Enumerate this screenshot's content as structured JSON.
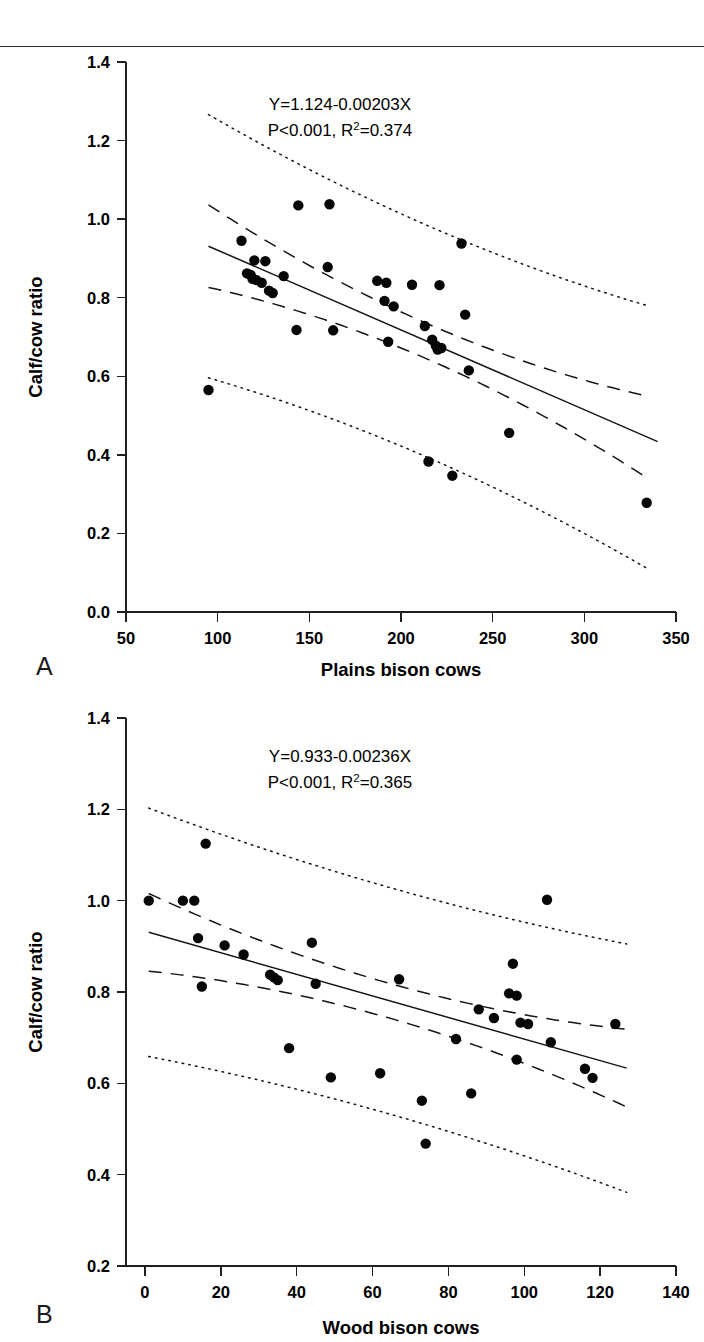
{
  "figure": {
    "panel_a_letter": "A",
    "panel_b_letter": "B"
  },
  "chart_data": [
    {
      "id": "panel-a",
      "type": "scatter",
      "title": "",
      "panel_label": "A",
      "xlabel": "Plains bison cows",
      "ylabel": "Calf/cow ratio",
      "xlim": [
        50,
        350
      ],
      "ylim": [
        0.0,
        1.4
      ],
      "xticks": [
        50,
        100,
        150,
        200,
        250,
        300,
        350
      ],
      "xticklabels": [
        "50",
        "100",
        "150",
        "200",
        "250",
        "300",
        "350"
      ],
      "yticks": [
        0.0,
        0.2,
        0.4,
        0.6,
        0.8,
        1.0,
        1.2,
        1.4
      ],
      "yticklabels": [
        "0.0",
        "0.2",
        "0.4",
        "0.6",
        "0.8",
        "1.0",
        "1.2",
        "1.4"
      ],
      "grid": false,
      "legend": "none",
      "annotation_line1": "Y=1.124-0.00203X",
      "annotation_line2_pre": "P<0.001, R",
      "annotation_line2_sup": "2",
      "annotation_line2_post": "=0.374",
      "equation": "Y=1.124-0.00203X",
      "p_value": "P<0.001",
      "r_squared": "0.374",
      "intercept": 1.124,
      "slope": -0.00203,
      "fit_x_range": [
        95,
        340
      ],
      "band_x_range": [
        95,
        335
      ],
      "ci_halfwidth_center": 0.045,
      "ci_halfwidth_edge": 0.105,
      "pi_halfwidth_center": 0.295,
      "pi_halfwidth_edge": 0.335,
      "points": [
        {
          "x": 95,
          "y": 0.565
        },
        {
          "x": 113,
          "y": 0.945
        },
        {
          "x": 120,
          "y": 0.895
        },
        {
          "x": 126,
          "y": 0.893
        },
        {
          "x": 116,
          "y": 0.862
        },
        {
          "x": 118,
          "y": 0.858
        },
        {
          "x": 119,
          "y": 0.848
        },
        {
          "x": 121,
          "y": 0.845
        },
        {
          "x": 124,
          "y": 0.838
        },
        {
          "x": 128,
          "y": 0.818
        },
        {
          "x": 130,
          "y": 0.812
        },
        {
          "x": 136,
          "y": 0.855
        },
        {
          "x": 144,
          "y": 1.035
        },
        {
          "x": 143,
          "y": 0.718
        },
        {
          "x": 161,
          "y": 1.038
        },
        {
          "x": 160,
          "y": 0.878
        },
        {
          "x": 163,
          "y": 0.717
        },
        {
          "x": 187,
          "y": 0.843
        },
        {
          "x": 192,
          "y": 0.838
        },
        {
          "x": 191,
          "y": 0.792
        },
        {
          "x": 196,
          "y": 0.778
        },
        {
          "x": 193,
          "y": 0.688
        },
        {
          "x": 206,
          "y": 0.833
        },
        {
          "x": 213,
          "y": 0.728
        },
        {
          "x": 215,
          "y": 0.383
        },
        {
          "x": 217,
          "y": 0.693
        },
        {
          "x": 219,
          "y": 0.678
        },
        {
          "x": 220,
          "y": 0.668
        },
        {
          "x": 222,
          "y": 0.672
        },
        {
          "x": 221,
          "y": 0.832
        },
        {
          "x": 228,
          "y": 0.347
        },
        {
          "x": 233,
          "y": 0.938
        },
        {
          "x": 235,
          "y": 0.757
        },
        {
          "x": 237,
          "y": 0.615
        },
        {
          "x": 259,
          "y": 0.456
        },
        {
          "x": 334,
          "y": 0.278
        }
      ]
    },
    {
      "id": "panel-b",
      "type": "scatter",
      "title": "",
      "panel_label": "B",
      "xlabel": "Wood bison cows",
      "ylabel": "Calf/cow ratio",
      "xlim": [
        -5,
        140
      ],
      "ylim": [
        0.2,
        1.4
      ],
      "xticks": [
        0,
        20,
        40,
        60,
        80,
        100,
        120,
        140
      ],
      "xticklabels": [
        "0",
        "20",
        "40",
        "60",
        "80",
        "100",
        "120",
        "140"
      ],
      "yticks": [
        0.2,
        0.4,
        0.6,
        0.8,
        1.0,
        1.2,
        1.4
      ],
      "yticklabels": [
        "0.2",
        "0.4",
        "0.6",
        "0.8",
        "1.0",
        "1.2",
        "1.4"
      ],
      "grid": false,
      "legend": "none",
      "annotation_line1": "Y=0.933-0.00236X",
      "annotation_line2_pre": "P<0.001, R",
      "annotation_line2_sup": "2",
      "annotation_line2_post": "=0.365",
      "equation": "Y=0.933-0.00236X",
      "p_value": "P<0.001",
      "r_squared": "0.365",
      "intercept": 0.933,
      "slope": -0.00236,
      "fit_x_range": [
        1,
        127
      ],
      "band_x_range": [
        1,
        127
      ],
      "ci_halfwidth_center": 0.038,
      "ci_halfwidth_edge": 0.085,
      "pi_halfwidth_center": 0.248,
      "pi_halfwidth_edge": 0.272,
      "points": [
        {
          "x": 1,
          "y": 1.0
        },
        {
          "x": 10,
          "y": 1.0
        },
        {
          "x": 13,
          "y": 1.0
        },
        {
          "x": 16,
          "y": 1.125
        },
        {
          "x": 14,
          "y": 0.918
        },
        {
          "x": 15,
          "y": 0.812
        },
        {
          "x": 21,
          "y": 0.902
        },
        {
          "x": 26,
          "y": 0.882
        },
        {
          "x": 33,
          "y": 0.838
        },
        {
          "x": 34,
          "y": 0.832
        },
        {
          "x": 35,
          "y": 0.826
        },
        {
          "x": 38,
          "y": 0.677
        },
        {
          "x": 44,
          "y": 0.908
        },
        {
          "x": 45,
          "y": 0.818
        },
        {
          "x": 49,
          "y": 0.613
        },
        {
          "x": 62,
          "y": 0.622
        },
        {
          "x": 67,
          "y": 0.828
        },
        {
          "x": 73,
          "y": 0.562
        },
        {
          "x": 74,
          "y": 0.468
        },
        {
          "x": 82,
          "y": 0.697
        },
        {
          "x": 86,
          "y": 0.578
        },
        {
          "x": 88,
          "y": 0.762
        },
        {
          "x": 92,
          "y": 0.743
        },
        {
          "x": 97,
          "y": 0.862
        },
        {
          "x": 96,
          "y": 0.797
        },
        {
          "x": 98,
          "y": 0.792
        },
        {
          "x": 99,
          "y": 0.733
        },
        {
          "x": 101,
          "y": 0.73
        },
        {
          "x": 98,
          "y": 0.652
        },
        {
          "x": 106,
          "y": 1.002
        },
        {
          "x": 107,
          "y": 0.69
        },
        {
          "x": 116,
          "y": 0.632
        },
        {
          "x": 118,
          "y": 0.612
        },
        {
          "x": 124,
          "y": 0.73
        }
      ]
    }
  ]
}
